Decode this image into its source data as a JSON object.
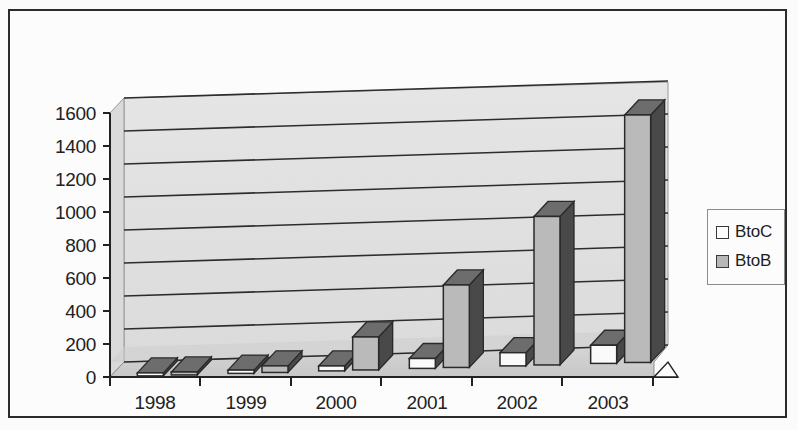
{
  "chart_data": {
    "type": "bar",
    "title": "",
    "subtitle": "",
    "xlabel": "",
    "ylabel": "",
    "categories": [
      "1998",
      "1999",
      "2000",
      "2001",
      "2002",
      "2003"
    ],
    "series": [
      {
        "name": "BtoC",
        "values": [
          10,
          20,
          30,
          60,
          80,
          110
        ],
        "color": "#ffffff"
      },
      {
        "name": "BtoB",
        "values": [
          15,
          40,
          200,
          500,
          900,
          1500
        ],
        "color": "#b8b8b8"
      }
    ],
    "ylim": [
      0,
      1600
    ],
    "ytick_labels": [
      "0",
      "200",
      "400",
      "600",
      "800",
      "1000",
      "1200",
      "1400",
      "1600"
    ],
    "ytick_values": [
      0,
      200,
      400,
      600,
      800,
      1000,
      1200,
      1400,
      1600
    ],
    "grid": true,
    "grid_axis": "y",
    "legend": [
      "BtoC",
      "BtoB"
    ],
    "legend_position": "right",
    "three_d": true,
    "style": "grayscale-scanned"
  },
  "legend": {
    "entries": [
      {
        "label": "BtoC",
        "swatch": "#ffffff"
      },
      {
        "label": "BtoB",
        "swatch": "#b9b9b9"
      }
    ]
  },
  "axes": {
    "y_ticks": [
      "1600",
      "1400",
      "1200",
      "1000",
      "800",
      "600",
      "400",
      "200",
      "0"
    ],
    "x_ticks": [
      "1998",
      "1999",
      "2000",
      "2001",
      "2002",
      "2003"
    ]
  },
  "colors": {
    "frame": "#2c2c2c",
    "wall": "#e3e3e3",
    "floor": "#d2d2d2",
    "gridline": "#2d2d2d",
    "bar_btoc_face": "#fdfdfd",
    "bar_btob_face": "#bcbcbc",
    "bar_shadow": "#4a4a4a",
    "bar_top": "#6e6e6e",
    "text": "#1f1f1f"
  }
}
